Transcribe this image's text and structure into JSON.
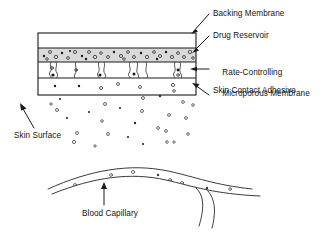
{
  "figure": {
    "type": "cross-section-diagram",
    "background_color": "#ffffff",
    "line_color": "#1a1a1a"
  },
  "labels": {
    "backing_membrane": "Backing Membrane",
    "drug_reservoir": "Drug Reservoir",
    "rate_controlling_line1": "Rate-Controlling",
    "rate_controlling_line2": "Microporous Membrane",
    "skin_contact_adhesive": "Skin Contact Adhesive",
    "skin_surface": "Skin Surface",
    "blood_capillary": "Blood Capillary"
  },
  "patch": {
    "x": 38,
    "y": 33,
    "width": 158,
    "height": 62,
    "layers": [
      {
        "name": "backing-membrane",
        "y": 33,
        "height": 15,
        "fill": "#ffffff",
        "particles": 0
      },
      {
        "name": "drug-reservoir",
        "y": 48,
        "height": 14,
        "fill": "#d9d9d9",
        "particles": 30
      },
      {
        "name": "rate-controlling-microporous-membrane",
        "y": 62,
        "height": 16,
        "fill": "#ffffff",
        "pores": 7
      },
      {
        "name": "skin-contact-adhesive",
        "y": 78,
        "height": 17,
        "fill": "#ffffff",
        "particles": 6
      }
    ]
  },
  "capillary": {
    "name": "blood-capillary",
    "particles_inside": 7,
    "branch": true
  },
  "diffusion": {
    "name": "drug-particle-cloud",
    "particle_count": 27,
    "region": {
      "x": 50,
      "y": 96,
      "width": 160,
      "height": 72
    }
  },
  "callouts": [
    {
      "name": "backing-membrane",
      "style": "arrow-down-left"
    },
    {
      "name": "drug-reservoir",
      "style": "arrow-down-left"
    },
    {
      "name": "rate-controlling-microporous-membrane",
      "style": "arrow-left"
    },
    {
      "name": "skin-contact-adhesive",
      "style": "arrow-up-left"
    },
    {
      "name": "skin-surface",
      "style": "arrow-up-left"
    },
    {
      "name": "blood-capillary",
      "style": "arrow-up"
    }
  ]
}
